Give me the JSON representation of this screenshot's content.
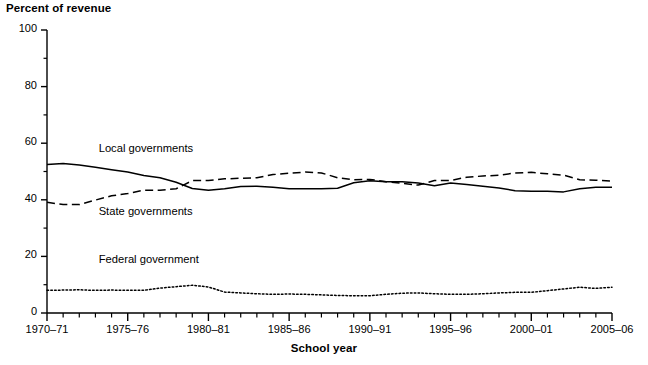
{
  "chart_data": {
    "type": "line",
    "title": "",
    "ylabel": "Percent of revenue",
    "xlabel": "School year",
    "ylim": [
      0,
      100
    ],
    "yticks": [
      0,
      20,
      40,
      60,
      80,
      100
    ],
    "yminor_step": 10,
    "grid": false,
    "legend_position": "inline-annotations",
    "x": [
      "1970–71",
      "1971–72",
      "1972–73",
      "1973–74",
      "1974–75",
      "1975–76",
      "1976–77",
      "1977–78",
      "1978–79",
      "1979–80",
      "1980–81",
      "1981–82",
      "1982–83",
      "1983–84",
      "1984–85",
      "1985–86",
      "1986–87",
      "1987–88",
      "1988–89",
      "1989–90",
      "1990–91",
      "1991–92",
      "1992–93",
      "1993–94",
      "1994–95",
      "1995–96",
      "1996–97",
      "1997–98",
      "1998–99",
      "1999–00",
      "2000–01",
      "2001–02",
      "2002–03",
      "2003–04",
      "2004–05",
      "2005–06"
    ],
    "xtick_labels": [
      "1970–71",
      "1975–76",
      "1980–81",
      "1985–86",
      "1990–91",
      "1995–96",
      "2000–01",
      "2005–06"
    ],
    "xtick_indices": [
      0,
      5,
      10,
      15,
      20,
      25,
      30,
      35
    ],
    "series": [
      {
        "name": "Local governments",
        "style": "solid",
        "label_x_index": 3.2,
        "label_y": 57.5,
        "values": [
          52.5,
          52.8,
          52.3,
          51.5,
          50.6,
          49.8,
          48.6,
          47.8,
          46.2,
          44.0,
          43.4,
          43.9,
          44.7,
          44.8,
          44.4,
          43.9,
          43.9,
          43.9,
          44.1,
          46.0,
          46.7,
          46.4,
          46.4,
          45.9,
          45.0,
          45.9,
          45.4,
          44.8,
          44.2,
          43.2,
          43.0,
          43.0,
          42.8,
          43.9,
          44.4,
          44.4
        ]
      },
      {
        "name": "State governments",
        "style": "dashed",
        "label_x_index": 3.2,
        "label_y": 35.5,
        "values": [
          39.1,
          38.3,
          38.3,
          39.9,
          41.4,
          42.2,
          43.4,
          43.4,
          43.9,
          46.8,
          46.8,
          47.4,
          47.6,
          47.8,
          48.9,
          49.4,
          49.8,
          49.5,
          47.8,
          47.1,
          47.2,
          46.4,
          45.8,
          45.2,
          46.8,
          46.8,
          48.0,
          48.4,
          48.7,
          49.5,
          49.7,
          49.2,
          48.7,
          47.1,
          46.9,
          46.6
        ]
      },
      {
        "name": "Federal government",
        "style": "dotted",
        "label_x_index": 3.2,
        "label_y": 18.5,
        "values": [
          8.0,
          8.1,
          8.2,
          8.0,
          8.1,
          8.0,
          8.0,
          8.8,
          9.3,
          9.8,
          9.2,
          7.4,
          7.1,
          6.8,
          6.6,
          6.7,
          6.6,
          6.4,
          6.2,
          6.1,
          6.1,
          6.6,
          7.0,
          7.1,
          6.8,
          6.6,
          6.6,
          6.8,
          7.1,
          7.3,
          7.3,
          7.9,
          8.5,
          9.1,
          8.7,
          9.1
        ]
      }
    ]
  }
}
